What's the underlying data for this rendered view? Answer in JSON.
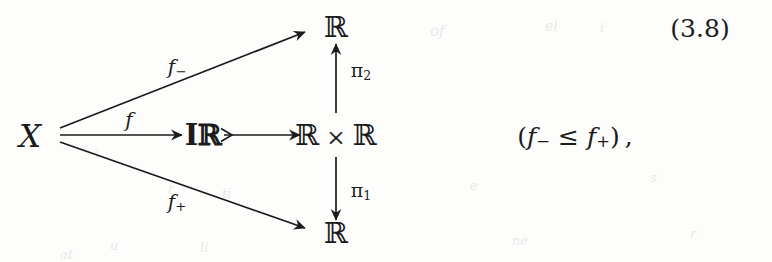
{
  "figure": {
    "kind": "commutative-diagram",
    "equation_number": "(3.8)",
    "trailing_expression": {
      "open_paren": "(",
      "left": "f",
      "left_sub": "−",
      "relation": "≤",
      "right": "f",
      "right_sub": "+",
      "close_paren": ")",
      "comma": ","
    },
    "ink_color": "#1b1b1b",
    "paper_color": "#fdfdfc"
  },
  "nodes": [
    {
      "id": "x",
      "label": "X",
      "kind": "source-object"
    },
    {
      "id": "r_top",
      "label": "ℝ",
      "kind": "target-object"
    },
    {
      "id": "ir",
      "label": "Iℝ",
      "kind": "interval-domain-object"
    },
    {
      "id": "rxr",
      "label_left": "ℝ",
      "label_times": "×",
      "label_right": "ℝ",
      "kind": "product-object"
    },
    {
      "id": "r_bot",
      "label": "ℝ",
      "kind": "target-object"
    }
  ],
  "edges": [
    {
      "id": "f_minus",
      "from": "x",
      "to": "r_top",
      "label": "f",
      "sub": "−",
      "style": "arrow"
    },
    {
      "id": "f",
      "from": "x",
      "to": "ir",
      "label": "f",
      "sub": "",
      "style": "arrow"
    },
    {
      "id": "f_plus",
      "from": "x",
      "to": "r_bot",
      "label": "f",
      "sub": "+",
      "style": "arrow"
    },
    {
      "id": "embed",
      "from": "ir",
      "to": "rxr",
      "label": "",
      "sub": "",
      "style": "monic-arrow"
    },
    {
      "id": "pi2",
      "from": "rxr",
      "to": "r_top",
      "label": "π",
      "sub": "2",
      "style": "arrow"
    },
    {
      "id": "pi1",
      "from": "rxr",
      "to": "r_bot",
      "label": "π",
      "sub": "1",
      "style": "arrow"
    }
  ],
  "ghosts": [
    {
      "text": "of",
      "x": 430,
      "y": 22,
      "size": 15
    },
    {
      "text": "el",
      "x": 545,
      "y": 18,
      "size": 14
    },
    {
      "text": "i",
      "x": 600,
      "y": 20,
      "size": 13
    },
    {
      "text": "i",
      "x": 95,
      "y": 146,
      "size": 13
    },
    {
      "text": "t",
      "x": 168,
      "y": 182,
      "size": 13
    },
    {
      "text": "ti",
      "x": 222,
      "y": 186,
      "size": 13
    },
    {
      "text": "u",
      "x": 110,
      "y": 238,
      "size": 13
    },
    {
      "text": "at",
      "x": 60,
      "y": 247,
      "size": 13
    },
    {
      "text": "li",
      "x": 200,
      "y": 240,
      "size": 13
    },
    {
      "text": "e",
      "x": 470,
      "y": 178,
      "size": 13
    },
    {
      "text": "s",
      "x": 650,
      "y": 170,
      "size": 13
    },
    {
      "text": "ne",
      "x": 512,
      "y": 233,
      "size": 13
    },
    {
      "text": "r",
      "x": 690,
      "y": 226,
      "size": 13
    }
  ]
}
